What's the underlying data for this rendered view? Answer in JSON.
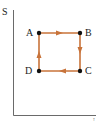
{
  "diagram": {
    "type": "thermodynamic-cycle",
    "y_axis_label": "S",
    "x_axis_label": "T",
    "points": [
      {
        "name": "A",
        "x": 39,
        "y": 33
      },
      {
        "name": "B",
        "x": 80,
        "y": 33
      },
      {
        "name": "C",
        "x": 80,
        "y": 71
      },
      {
        "name": "D",
        "x": 39,
        "y": 71
      }
    ],
    "edges": [
      {
        "from": "A",
        "to": "B"
      },
      {
        "from": "B",
        "to": "C"
      },
      {
        "from": "C",
        "to": "D"
      },
      {
        "from": "D",
        "to": "A"
      }
    ],
    "colors": {
      "path": "#c8733a",
      "point": "#111111",
      "axis": "#444444"
    }
  }
}
